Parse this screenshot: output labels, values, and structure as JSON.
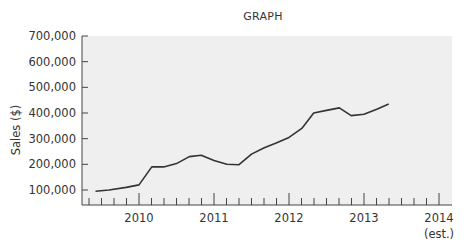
{
  "chart_data": {
    "type": "line",
    "title": "GRAPH",
    "xlabel": "",
    "ylabel": "Sales ($)",
    "ylim": [
      50000,
      700000
    ],
    "yticks": [
      100000,
      200000,
      300000,
      400000,
      500000,
      600000,
      700000
    ],
    "ytick_labels": [
      "100,000",
      "200,000",
      "300,000",
      "400,000",
      "500,000",
      "600,000",
      "700,000"
    ],
    "xticks": [
      2010,
      2011,
      2012,
      2013,
      2014
    ],
    "xtick_labels": [
      "2010",
      "2011",
      "2012",
      "2013",
      "2014"
    ],
    "xtick_note": "(est.)",
    "xlim": [
      2009.25,
      2014.1
    ],
    "minor_ticks_per_year": 6,
    "grid": false,
    "background": "#efefef",
    "line_color": "#333333",
    "series": [
      {
        "name": "Sales",
        "x": [
          2009.42,
          2009.6,
          2009.83,
          2010.0,
          2010.17,
          2010.33,
          2010.5,
          2010.67,
          2010.83,
          2011.0,
          2011.17,
          2011.33,
          2011.5,
          2011.67,
          2011.83,
          2012.0,
          2012.17,
          2012.33,
          2012.5,
          2012.67,
          2012.83,
          2013.0,
          2013.17,
          2013.33,
          2013.5,
          2013.67,
          2013.83,
          2014.0
        ],
        "values": [
          95000,
          100000,
          110000,
          120000,
          190000,
          190000,
          203000,
          230000,
          235000,
          215000,
          200000,
          198000,
          240000,
          265000,
          283000,
          305000,
          340000,
          400000,
          410000,
          420000,
          390000,
          395000,
          415000,
          435000,
          435000,
          435000,
          435000,
          435000
        ]
      }
    ]
  }
}
